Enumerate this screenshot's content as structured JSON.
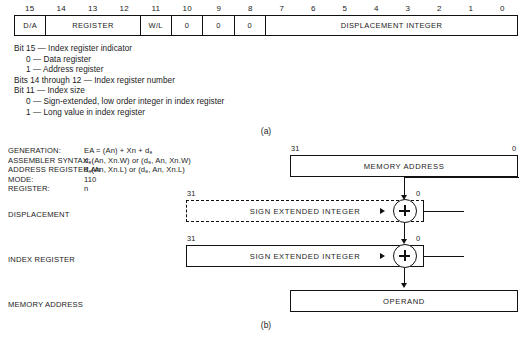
{
  "figure": {
    "caption_a": "(a)",
    "caption_b": "(b)"
  },
  "bitfield": {
    "bit_numbers": [
      "15",
      "14",
      "13",
      "12",
      "11",
      "10",
      "9",
      "8",
      "7",
      "6",
      "5",
      "4",
      "3",
      "2",
      "1",
      "0"
    ],
    "fields": [
      {
        "label": "D/A",
        "bits": 1
      },
      {
        "label": "REGISTER",
        "bits": 3
      },
      {
        "label": "W/L",
        "bits": 1
      },
      {
        "label": "0",
        "bits": 1
      },
      {
        "label": "0",
        "bits": 1
      },
      {
        "label": "0",
        "bits": 1
      },
      {
        "label": "DISPLACEMENT INTEGER",
        "bits": 8
      }
    ]
  },
  "description": {
    "lines": [
      {
        "indent": 0,
        "text": "Bit 15 — Index register indicator"
      },
      {
        "indent": 1,
        "text": "0 — Data register"
      },
      {
        "indent": 1,
        "text": "1 — Address register"
      },
      {
        "indent": 0,
        "text": "Bits 14 through 12 — Index register number"
      },
      {
        "indent": 0,
        "text": "Bit 11 — Index size"
      },
      {
        "indent": 1,
        "text": "0 — Sign-extended, low order integer in index register"
      },
      {
        "indent": 1,
        "text": "1 — Long value in index register"
      }
    ]
  },
  "spec": {
    "generation_key": "GENERATION:",
    "generation_value": "EA = (An) + Xn + d₈",
    "assembler_key": "ASSEMBLER SYNTAX:",
    "assembler_value": "d₈(An, Xn.W) or (d₈, An, Xn.W)",
    "assembler_value2": "d₈(An, Xn.L) or (d₈, An, Xn.L)",
    "mode_key": "MODE:",
    "mode_value": "110",
    "register_key": "REGISTER:",
    "register_value": "n"
  },
  "diagram": {
    "rows": [
      {
        "label": "ADDRESS REGISTER An",
        "box_text": "MEMORY ADDRESS",
        "msb": "31",
        "lsb": "0",
        "dashed": false
      },
      {
        "label": "DISPLACEMENT",
        "box_text": "SIGN EXTENDED INTEGER",
        "msb": "31",
        "lsb": "0",
        "dashed": true
      },
      {
        "label": "INDEX REGISTER",
        "box_text": "SIGN EXTENDED INTEGER",
        "msb": "31",
        "lsb": "0",
        "dashed": false
      },
      {
        "label": "MEMORY ADDRESS",
        "box_text": "OPERAND",
        "msb": "",
        "lsb": "",
        "dashed": false
      }
    ],
    "adder_symbol": "+"
  },
  "colors": {
    "ink": "#111111",
    "background": "#ffffff"
  }
}
